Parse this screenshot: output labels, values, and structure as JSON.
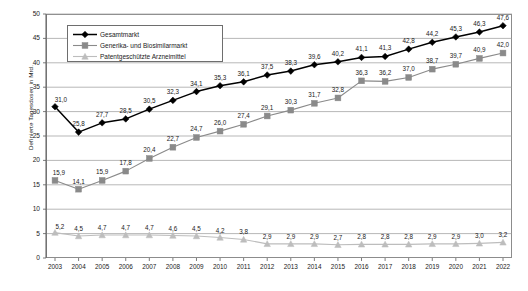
{
  "chart_data": {
    "type": "line",
    "title": "",
    "xlabel": "",
    "ylabel": "Definierte Tagesdosen in Mrd.",
    "ylim": [
      0,
      50
    ],
    "yticks": [
      "0",
      "5",
      "10",
      "15",
      "20",
      "25",
      "30",
      "35",
      "40",
      "45",
      "50"
    ],
    "grid": true,
    "legend_position": "top-left-inside",
    "decimal_separator": ",",
    "categories": [
      "2003",
      "2004",
      "2005",
      "2006",
      "2007",
      "2008",
      "2009",
      "2010",
      "2011",
      "2012",
      "2013",
      "2014",
      "2015",
      "2016",
      "2017",
      "2018",
      "2019",
      "2020",
      "2021",
      "2022"
    ],
    "series": [
      {
        "name": "Gesamtmarkt",
        "marker": "diamond",
        "color": "#000000",
        "values": [
          31.0,
          25.8,
          27.7,
          28.5,
          30.5,
          32.3,
          34.1,
          35.3,
          36.1,
          37.5,
          38.3,
          39.6,
          40.2,
          41.1,
          41.3,
          42.8,
          44.2,
          45.3,
          46.3,
          47.6
        ],
        "labels": [
          "31,0",
          "25,8",
          "27,7",
          "28,5",
          "30,5",
          "32,3",
          "34,1",
          "35,3",
          "36,1",
          "37,5",
          "38,3",
          "39,6",
          "40,2",
          "41,1",
          "41,3",
          "42,8",
          "44,2",
          "45,3",
          "46,3",
          "47,6"
        ]
      },
      {
        "name": "Generika- und Biosimilarmarkt",
        "marker": "square",
        "color": "#8a8a8a",
        "values": [
          15.9,
          14.1,
          15.9,
          17.8,
          20.4,
          22.7,
          24.7,
          26.0,
          27.4,
          29.1,
          30.3,
          31.7,
          32.8,
          36.3,
          36.2,
          37.0,
          38.7,
          39.7,
          40.9,
          42.0
        ],
        "labels": [
          "15,9",
          "14,1",
          "15,9",
          "17,8",
          "20,4",
          "22,7",
          "24,7",
          "26,0",
          "27,4",
          "29,1",
          "30,3",
          "31,7",
          "32,8",
          "36,3",
          "36,2",
          "37,0",
          "38,7",
          "39,7",
          "40,9",
          "42,0"
        ]
      },
      {
        "name": "Patentgeschützte Arzneimittel",
        "marker": "triangle",
        "color": "#bdbdbd",
        "values": [
          5.2,
          4.5,
          4.7,
          4.7,
          4.7,
          4.6,
          4.5,
          4.2,
          3.8,
          2.9,
          2.9,
          2.9,
          2.7,
          2.8,
          2.8,
          2.8,
          2.9,
          2.9,
          3.0,
          3.2
        ],
        "labels": [
          "5,2",
          "4,5",
          "4,7",
          "4,7",
          "4,7",
          "4,6",
          "4,5",
          "4,2",
          "3,8",
          "2,9",
          "2,9",
          "2,9",
          "2,7",
          "2,8",
          "2,8",
          "2,8",
          "2,9",
          "2,9",
          "3,0",
          "3,2"
        ]
      }
    ]
  },
  "colors": {
    "frame": "#8c8c8c",
    "grid": "#9a9a9a",
    "background": "#ffffff",
    "text": "#1a1a1a"
  }
}
